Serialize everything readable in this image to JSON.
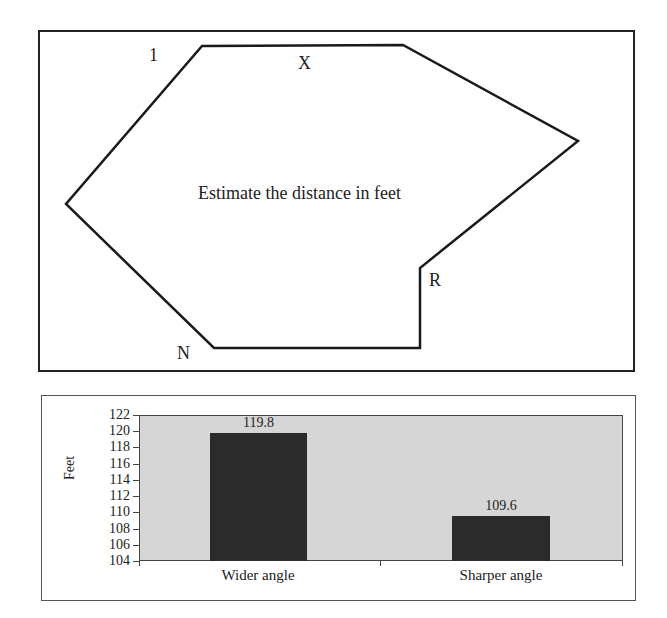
{
  "diagram": {
    "instruction": "Estimate the distance in feet",
    "labels": {
      "one": "1",
      "x": "X",
      "r": "R",
      "n": "N"
    },
    "polygon_points": "202,46 403,45 578,141 420,268 420,348 214,348 66,204"
  },
  "chart_data": {
    "type": "bar",
    "title": "",
    "categories": [
      "Wider angle",
      "Sharper angle"
    ],
    "values": [
      119.8,
      109.6
    ],
    "data_labels": [
      "119.8",
      "109.6"
    ],
    "xlabel": "",
    "ylabel": "Feet",
    "ylim": [
      104,
      122
    ],
    "yticks": [
      "122",
      "120",
      "118",
      "116",
      "114",
      "112",
      "110",
      "108",
      "106",
      "104"
    ],
    "grid": false,
    "legend": null,
    "bar_color": "#2b2b2b",
    "plot_background": "#d6d6d6"
  }
}
